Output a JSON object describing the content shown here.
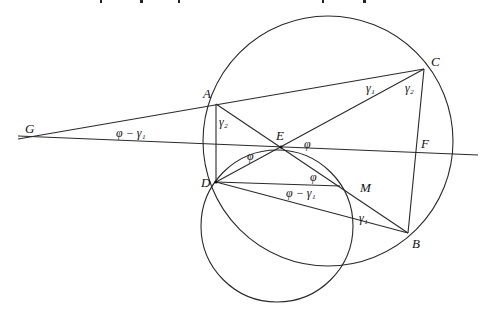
{
  "figure": {
    "points": {
      "A": {
        "label": "A",
        "x": 216,
        "y": 104,
        "lx": 203,
        "ly": 98
      },
      "B": {
        "label": "B",
        "x": 408,
        "y": 233,
        "lx": 412,
        "ly": 248
      },
      "C": {
        "label": "C",
        "x": 424,
        "y": 69,
        "lx": 431,
        "ly": 66
      },
      "D": {
        "label": "D",
        "x": 216,
        "y": 182,
        "lx": 201,
        "ly": 187
      },
      "E": {
        "label": "E",
        "x": 281,
        "y": 147,
        "lx": 276,
        "ly": 140
      },
      "F": {
        "label": "F",
        "x": 416,
        "y": 153,
        "lx": 421,
        "ly": 148
      },
      "G": {
        "label": "G",
        "x": 30,
        "y": 137,
        "lx": 25,
        "ly": 133
      },
      "M": {
        "label": "M",
        "x": 340,
        "y": 186,
        "lx": 360,
        "ly": 192
      }
    },
    "circles": [
      {
        "name": "circumcircle-ABCD",
        "cx": 328,
        "cy": 141,
        "r": 125
      },
      {
        "name": "circle-DEM",
        "cx": 277,
        "cy": 226,
        "r": 76
      }
    ],
    "angle_labels": [
      {
        "text": "φ − γ₁",
        "x": 116,
        "y": 137,
        "near": "G"
      },
      {
        "text": "γ₂",
        "x": 219,
        "y": 126,
        "near": "A"
      },
      {
        "text": "φ",
        "x": 247,
        "y": 160,
        "near": "E-left"
      },
      {
        "text": "φ",
        "x": 304,
        "y": 148,
        "near": "E-right"
      },
      {
        "text": "γ₁",
        "x": 366,
        "y": 92,
        "near": "C-upper"
      },
      {
        "text": "γ₂",
        "x": 405,
        "y": 92,
        "near": "C-lower"
      },
      {
        "text": "φ",
        "x": 310,
        "y": 181,
        "near": "M"
      },
      {
        "text": "φ − γ₁",
        "x": 286,
        "y": 197,
        "near": "D-M"
      },
      {
        "text": "γ₁",
        "x": 359,
        "y": 222,
        "near": "B"
      }
    ]
  }
}
